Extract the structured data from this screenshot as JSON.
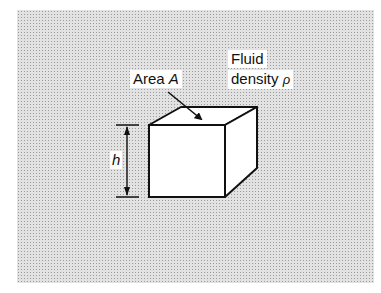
{
  "figure": {
    "labels": {
      "area": "Area",
      "area_symbol": "A",
      "fluid_line1": "Fluid",
      "fluid_line2": "density",
      "density_symbol": "ρ",
      "height_symbol": "h"
    },
    "colors": {
      "background_stipple": "#e2e2e2",
      "cube_fill": "#ffffff",
      "line": "#111111"
    }
  }
}
